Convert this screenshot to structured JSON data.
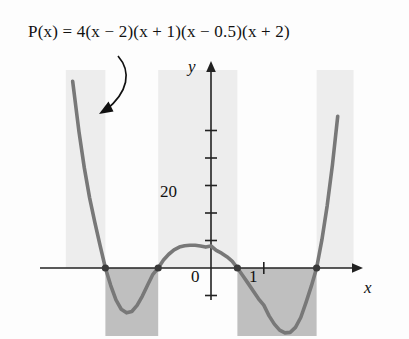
{
  "figure": {
    "formula": "P(x) = 4(x − 2)(x + 1)(x − 0.5)(x + 2)",
    "x_axis_name": "x",
    "y_axis_name": "y",
    "annotation_arrow": "curved-arrow-to-curve"
  },
  "chart_data": {
    "type": "line",
    "title": "P(x) = 4(x − 2)(x + 1)(x − 0.5)(x + 2)",
    "xlabel": "x",
    "ylabel": "y",
    "xlim": [
      -2.75,
      2.7
    ],
    "ylim": [
      -34,
      68
    ],
    "grid": false,
    "legend": null,
    "x_tick_labels": [
      "0",
      "1"
    ],
    "x_ticks": [
      0,
      1
    ],
    "y_tick_labels": [
      "20"
    ],
    "y_ticks": [
      20
    ],
    "y_tick_marks": [
      -10,
      10,
      20,
      30,
      40,
      50
    ],
    "function": "4(x-2)(x+1)(x-0.5)(x+2)",
    "roots": [
      -2,
      -1,
      0.5,
      2
    ],
    "root_markers": [
      {
        "x": -2,
        "y": 0
      },
      {
        "x": -1,
        "y": 0
      },
      {
        "x": 0.5,
        "y": 0
      },
      {
        "x": 2,
        "y": 0
      }
    ],
    "y_intercept": 8,
    "local_extrema": [
      {
        "x": -1.55,
        "y": -15,
        "kind": "minimum"
      },
      {
        "x": -0.2,
        "y": 8.5,
        "kind": "maximum"
      },
      {
        "x": 1.4,
        "y": -24,
        "kind": "minimum"
      }
    ],
    "sign_bands": [
      {
        "interval": [
          -2.75,
          -2
        ],
        "sign": "positive",
        "shade": "light"
      },
      {
        "interval": [
          -2,
          -1
        ],
        "sign": "negative",
        "shade": "dark"
      },
      {
        "interval": [
          -1,
          0.5
        ],
        "sign": "positive",
        "shade": "light"
      },
      {
        "interval": [
          0.5,
          2
        ],
        "sign": "negative",
        "shade": "dark"
      },
      {
        "interval": [
          2,
          2.7
        ],
        "sign": "positive",
        "shade": "light"
      }
    ],
    "x": [
      -2.62,
      -2.5,
      -2.4,
      -2.3,
      -2.2,
      -2.1,
      -2.0,
      -1.9,
      -1.8,
      -1.7,
      -1.6,
      -1.5,
      -1.4,
      -1.3,
      -1.2,
      -1.1,
      -1.0,
      -0.9,
      -0.8,
      -0.7,
      -0.6,
      -0.5,
      -0.4,
      -0.3,
      -0.2,
      -0.1,
      0.0,
      0.1,
      0.2,
      0.3,
      0.4,
      0.5,
      0.6,
      0.7,
      0.8,
      0.9,
      1.0,
      1.1,
      1.2,
      1.3,
      1.4,
      1.5,
      1.6,
      1.7,
      1.8,
      1.9,
      2.0,
      2.1,
      2.2,
      2.3,
      2.4
    ],
    "y": [
      67.9,
      49.5,
      36.5,
      25.6,
      16.6,
      8.1,
      0.0,
      -6.3,
      -11.6,
      -15.0,
      -16.3,
      -15.8,
      -13.6,
      -10.2,
      -6.2,
      -2.3,
      0.0,
      2.9,
      5.0,
      6.6,
      7.6,
      8.1,
      8.3,
      8.3,
      8.0,
      7.6,
      8.0,
      6.4,
      5.4,
      4.1,
      2.5,
      0.0,
      -2.7,
      -5.5,
      -8.4,
      -11.2,
      -13.5,
      -17.4,
      -20.4,
      -22.6,
      -23.6,
      -23.4,
      -21.6,
      -18.0,
      -12.5,
      -6.6,
      0.0,
      10.2,
      22.6,
      37.5,
      55.2
    ]
  },
  "colors": {
    "curve": "#787878",
    "axis": "#222222",
    "band_light": "#ededed",
    "band_dark": "#bfbfbf",
    "text": "#111111"
  }
}
